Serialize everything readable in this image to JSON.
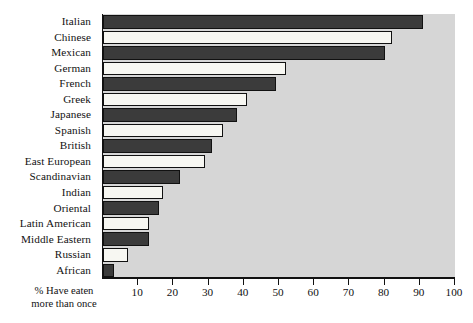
{
  "chart_data": {
    "type": "bar",
    "orientation": "horizontal",
    "title": "",
    "xlabel": "% Have eaten more than once",
    "ylabel": "",
    "xlim": [
      0,
      100
    ],
    "grid": false,
    "legend": null,
    "categories": [
      "Italian",
      "Chinese",
      "Mexican",
      "German",
      "French",
      "Greek",
      "Japanese",
      "Spanish",
      "British",
      "East European",
      "Scandinavian",
      "Indian",
      "Oriental",
      "Latin American",
      "Middle Eastern",
      "Russian",
      "African"
    ],
    "values": [
      91,
      82,
      80,
      52,
      49,
      41,
      38,
      34,
      31,
      29,
      22,
      17,
      16,
      13,
      13,
      7,
      3
    ],
    "bar_fills": [
      "dark",
      "light",
      "dark",
      "light",
      "dark",
      "light",
      "dark",
      "light",
      "dark",
      "light",
      "dark",
      "light",
      "dark",
      "light",
      "dark",
      "light",
      "dark"
    ],
    "xticks": [
      10,
      20,
      30,
      40,
      50,
      60,
      70,
      80,
      90,
      100
    ],
    "xtick_labels": [
      "10",
      "20",
      "30",
      "40",
      "50",
      "60",
      "70",
      "80",
      "90",
      "100"
    ],
    "colors": {
      "bar_dark": "#3b3b3b",
      "bar_light": "#f7f7f2",
      "plot_background": "#d6d6d6",
      "page_background": "#ffffff",
      "axis": "#111111",
      "text": "#121212"
    }
  },
  "axis_caption": {
    "line1": "%  Have eaten",
    "line2": "more than once"
  }
}
